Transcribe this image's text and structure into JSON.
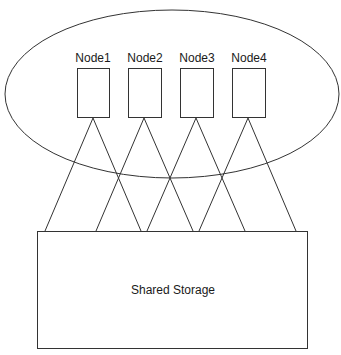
{
  "cluster": {
    "nodes": [
      {
        "label": "Node1"
      },
      {
        "label": "Node2"
      },
      {
        "label": "Node3"
      },
      {
        "label": "Node4"
      }
    ]
  },
  "storage": {
    "label": "Shared Storage"
  },
  "colors": {
    "stroke": "#333333",
    "background": "#ffffff"
  }
}
